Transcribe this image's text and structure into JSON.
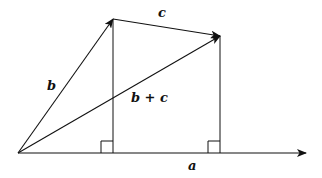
{
  "diagram": {
    "type": "vector-addition-projection",
    "labels": {
      "b": "b",
      "c": "c",
      "b_plus_c": "b + c",
      "a": "a"
    },
    "colors": {
      "stroke": "#111111",
      "background": "#ffffff"
    }
  }
}
